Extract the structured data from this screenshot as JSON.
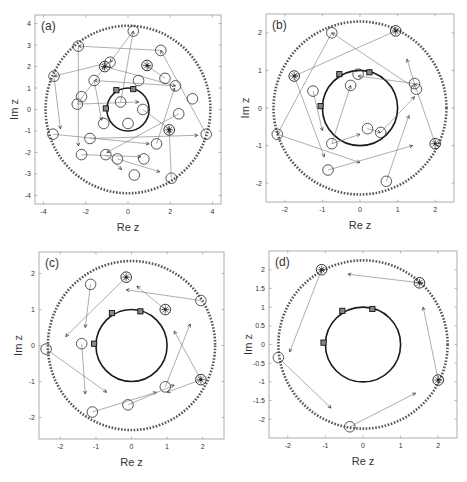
{
  "figure": {
    "panels": [
      {
        "id": "a",
        "label": "(a)"
      },
      {
        "id": "b",
        "label": "(b)"
      },
      {
        "id": "c",
        "label": "(c)"
      },
      {
        "id": "d",
        "label": "(d)"
      }
    ]
  },
  "chart_data": [
    {
      "type": "scatter",
      "panel": "(a)",
      "title": "",
      "xlabel": "Re z",
      "ylabel": "Im z",
      "xlim": [
        -4.4,
        4.4
      ],
      "ylim": [
        -4.4,
        4.4
      ],
      "xticks": [
        -4,
        -2,
        0,
        2,
        4
      ],
      "yticks": [
        -4,
        -3,
        -2,
        -1,
        0,
        1,
        2,
        3,
        4
      ],
      "grid": false,
      "unit_circle": {
        "radius": 1.0,
        "style": "solid-thick"
      },
      "outer_circle": {
        "radius": 3.9,
        "style": "dotted"
      },
      "squares": [
        [
          -1.05,
          0.05
        ],
        [
          -0.55,
          0.9
        ],
        [
          0.25,
          0.95
        ]
      ],
      "starred_points": [
        [
          -1.1,
          2.0
        ],
        [
          0.9,
          2.05
        ],
        [
          1.95,
          -0.95
        ]
      ],
      "circle_points": [
        [
          0.25,
          3.65
        ],
        [
          -2.35,
          2.95
        ],
        [
          1.55,
          2.75
        ],
        [
          -0.85,
          2.2
        ],
        [
          -3.5,
          1.55
        ],
        [
          1.75,
          1.45
        ],
        [
          -1.6,
          1.35
        ],
        [
          0.5,
          1.35
        ],
        [
          2.25,
          1.1
        ],
        [
          -2.2,
          0.6
        ],
        [
          3.05,
          0.5
        ],
        [
          -2.4,
          0.25
        ],
        [
          -0.35,
          0.35
        ],
        [
          0.7,
          0.0
        ],
        [
          2.4,
          -0.2
        ],
        [
          -1.15,
          -0.65
        ],
        [
          0.0,
          -0.65
        ],
        [
          -3.55,
          -1.15
        ],
        [
          -1.8,
          -1.35
        ],
        [
          3.7,
          -1.15
        ],
        [
          1.35,
          -1.6
        ],
        [
          -2.2,
          -2.1
        ],
        [
          -1.05,
          -2.1
        ],
        [
          -0.5,
          -2.3
        ],
        [
          0.75,
          -2.3
        ],
        [
          0.3,
          -3.05
        ],
        [
          2.05,
          -3.2
        ]
      ],
      "arrows": [
        [
          [
            0.25,
            3.65
          ],
          [
            -0.85,
            2.2
          ]
        ],
        [
          [
            -0.85,
            2.2
          ],
          [
            -3.5,
            1.55
          ]
        ],
        [
          [
            1.55,
            2.75
          ],
          [
            -2.35,
            2.95
          ]
        ],
        [
          [
            -2.35,
            2.95
          ],
          [
            -2.35,
            -1.7
          ]
        ],
        [
          [
            -3.5,
            1.55
          ],
          [
            -3.2,
            -0.9
          ]
        ],
        [
          [
            2.25,
            1.1
          ],
          [
            -1.6,
            1.35
          ]
        ],
        [
          [
            1.75,
            1.45
          ],
          [
            0.9,
            2.05
          ]
        ],
        [
          [
            -2.4,
            0.25
          ],
          [
            0.5,
            0.35
          ]
        ],
        [
          [
            -2.4,
            0.25
          ],
          [
            -1.1,
            2.0
          ]
        ],
        [
          [
            3.7,
            -1.15
          ],
          [
            1.55,
            2.75
          ]
        ],
        [
          [
            -3.55,
            -1.15
          ],
          [
            1.0,
            -1.6
          ]
        ],
        [
          [
            -2.2,
            -2.1
          ],
          [
            0.6,
            -2.2
          ]
        ],
        [
          [
            -0.5,
            -2.3
          ],
          [
            1.5,
            -2.9
          ]
        ],
        [
          [
            -1.8,
            -1.35
          ],
          [
            3.3,
            -1.2
          ]
        ],
        [
          [
            0.7,
            0.0
          ],
          [
            2.0,
            -0.95
          ]
        ],
        [
          [
            1.35,
            -1.6
          ],
          [
            2.2,
            1.0
          ]
        ],
        [
          [
            -1.05,
            -2.1
          ],
          [
            -0.3,
            -2.8
          ]
        ],
        [
          [
            2.4,
            -0.2
          ],
          [
            -1.0,
            -2.0
          ]
        ],
        [
          [
            2.05,
            -3.2
          ],
          [
            1.95,
            -0.95
          ]
        ],
        [
          [
            -1.6,
            1.35
          ],
          [
            -1.25,
            -0.5
          ]
        ],
        [
          [
            -1.1,
            2.0
          ],
          [
            2.25,
            1.1
          ]
        ],
        [
          [
            -0.35,
            0.35
          ],
          [
            0.25,
            3.65
          ]
        ]
      ]
    },
    {
      "type": "scatter",
      "panel": "(b)",
      "title": "",
      "xlabel": "Re z",
      "ylabel": "Im z",
      "xlim": [
        -2.5,
        2.5
      ],
      "ylim": [
        -2.5,
        2.5
      ],
      "xticks": [
        -2,
        -1,
        0,
        1,
        2
      ],
      "yticks": [
        -2,
        -1,
        0,
        1,
        2
      ],
      "grid": false,
      "unit_circle": {
        "radius": 1.0,
        "style": "solid-thick"
      },
      "outer_circle": {
        "radius": 2.3,
        "style": "dotted"
      },
      "squares": [
        [
          -1.05,
          0.05
        ],
        [
          -0.55,
          0.9
        ],
        [
          0.25,
          0.95
        ]
      ],
      "starred_points": [
        [
          0.95,
          2.05
        ],
        [
          -1.75,
          0.85
        ],
        [
          2.0,
          -0.95
        ]
      ],
      "circle_points": [
        [
          -0.75,
          2.0
        ],
        [
          -0.05,
          0.9
        ],
        [
          -0.25,
          0.6
        ],
        [
          -1.25,
          0.45
        ],
        [
          1.45,
          0.65
        ],
        [
          1.5,
          0.5
        ],
        [
          0.2,
          -0.55
        ],
        [
          0.55,
          -0.65
        ],
        [
          -0.75,
          -0.95
        ],
        [
          -2.2,
          -0.7
        ],
        [
          -0.85,
          -1.65
        ],
        [
          0.7,
          -1.95
        ]
      ],
      "arrows": [
        [
          [
            0.95,
            2.05
          ],
          [
            -1.75,
            0.85
          ]
        ],
        [
          [
            1.45,
            0.65
          ],
          [
            -0.05,
            0.85
          ]
        ],
        [
          [
            -0.75,
            2.0
          ],
          [
            -2.2,
            -0.7
          ]
        ],
        [
          [
            -1.75,
            0.85
          ],
          [
            -0.95,
            -1.3
          ]
        ],
        [
          [
            -2.2,
            -0.7
          ],
          [
            0.0,
            -1.45
          ]
        ],
        [
          [
            -0.85,
            -1.65
          ],
          [
            1.4,
            -1.0
          ]
        ],
        [
          [
            0.7,
            -1.95
          ],
          [
            1.3,
            -0.2
          ]
        ],
        [
          [
            -0.75,
            -0.95
          ],
          [
            0.0,
            -0.7
          ]
        ],
        [
          [
            0.2,
            -0.55
          ],
          [
            0.55,
            -0.65
          ]
        ],
        [
          [
            2.0,
            -0.95
          ],
          [
            1.45,
            0.65
          ]
        ],
        [
          [
            1.5,
            0.5
          ],
          [
            -0.75,
            2.0
          ]
        ],
        [
          [
            -1.25,
            0.45
          ],
          [
            -1.0,
            -0.6
          ]
        ],
        [
          [
            0.55,
            -0.65
          ],
          [
            1.45,
            0.3
          ]
        ],
        [
          [
            1.45,
            0.65
          ],
          [
            1.25,
            1.3
          ]
        ],
        [
          [
            -0.75,
            -0.95
          ],
          [
            -0.25,
            0.6
          ]
        ]
      ]
    },
    {
      "type": "scatter",
      "panel": "(c)",
      "title": "",
      "xlabel": "Re z",
      "ylabel": "Im z",
      "xlim": [
        -2.6,
        2.6
      ],
      "ylim": [
        -2.6,
        2.6
      ],
      "xticks": [
        -2,
        -1,
        0,
        1,
        2
      ],
      "yticks": [
        -2,
        -1,
        0,
        1,
        2
      ],
      "grid": false,
      "unit_circle": {
        "radius": 1.0,
        "style": "solid-thick"
      },
      "outer_circle": {
        "radius": 2.35,
        "style": "dotted"
      },
      "squares": [
        [
          -1.05,
          0.05
        ],
        [
          -0.55,
          0.9
        ],
        [
          0.25,
          0.95
        ]
      ],
      "starred_points": [
        [
          -0.15,
          1.9
        ],
        [
          0.95,
          1.0
        ],
        [
          1.95,
          -0.95
        ]
      ],
      "circle_points": [
        [
          -1.15,
          1.7
        ],
        [
          1.95,
          1.25
        ],
        [
          -1.4,
          0.05
        ],
        [
          -2.4,
          -0.1
        ],
        [
          0.95,
          -1.15
        ],
        [
          -0.1,
          -1.65
        ],
        [
          -1.1,
          -1.85
        ]
      ],
      "arrows": [
        [
          [
            1.95,
            1.25
          ],
          [
            -0.15,
            1.55
          ]
        ],
        [
          [
            -0.15,
            1.9
          ],
          [
            -1.85,
            0.25
          ]
        ],
        [
          [
            -1.15,
            1.7
          ],
          [
            -1.3,
            0.5
          ]
        ],
        [
          [
            -2.4,
            -0.1
          ],
          [
            -0.7,
            -1.3
          ]
        ],
        [
          [
            -1.4,
            0.05
          ],
          [
            -1.3,
            -1.35
          ]
        ],
        [
          [
            -1.1,
            -1.85
          ],
          [
            0.7,
            -1.3
          ]
        ],
        [
          [
            -0.1,
            -1.65
          ],
          [
            1.2,
            -1.1
          ]
        ],
        [
          [
            0.95,
            -1.15
          ],
          [
            1.65,
            0.6
          ]
        ],
        [
          [
            1.95,
            -0.95
          ],
          [
            1.2,
            0.4
          ]
        ],
        [
          [
            0.95,
            1.0
          ],
          [
            0.15,
            1.65
          ]
        ],
        [
          [
            1.95,
            -0.95
          ],
          [
            1.0,
            -1.3
          ]
        ]
      ]
    },
    {
      "type": "scatter",
      "panel": "(d)",
      "title": "",
      "xlabel": "Re z",
      "ylabel": "Im z",
      "xlim": [
        -2.5,
        2.5
      ],
      "ylim": [
        -2.5,
        2.5
      ],
      "xticks": [
        -2,
        -1,
        0,
        1,
        2
      ],
      "yticks": [
        -2,
        -1.5,
        -1,
        -0.5,
        0,
        0.5,
        1,
        1.5,
        2
      ],
      "grid": false,
      "unit_circle": {
        "radius": 1.0,
        "style": "solid-thick"
      },
      "outer_circle": {
        "radius": 2.25,
        "style": "dotted"
      },
      "squares": [
        [
          -1.05,
          0.05
        ],
        [
          -0.55,
          0.9
        ],
        [
          0.25,
          0.95
        ]
      ],
      "starred_points": [
        [
          -1.1,
          2.0
        ],
        [
          1.5,
          1.65
        ],
        [
          2.0,
          -0.95
        ]
      ],
      "circle_points": [
        [
          -2.25,
          -0.35
        ],
        [
          -0.35,
          -2.2
        ]
      ],
      "arrows": [
        [
          [
            1.5,
            1.65
          ],
          [
            -0.4,
            1.88
          ]
        ],
        [
          [
            -1.1,
            2.0
          ],
          [
            -1.95,
            -0.2
          ]
        ],
        [
          [
            -2.25,
            -0.35
          ],
          [
            -0.85,
            -1.7
          ]
        ],
        [
          [
            -0.35,
            -2.2
          ],
          [
            1.4,
            -1.3
          ]
        ],
        [
          [
            2.0,
            -0.95
          ],
          [
            1.6,
            1.0
          ]
        ]
      ]
    }
  ]
}
